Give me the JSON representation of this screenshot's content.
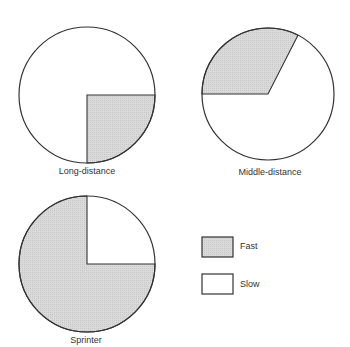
{
  "chart_data": [
    {
      "type": "pie",
      "title": "Long-distance",
      "categories": [
        "Fast",
        "Slow"
      ],
      "values": [
        25,
        75
      ],
      "layout": {
        "cx": 87,
        "cy": 95,
        "r": 68,
        "fast_start_deg": 0,
        "fast_end_deg": 90
      }
    },
    {
      "type": "pie",
      "title": "Middle-distance",
      "categories": [
        "Fast",
        "Slow"
      ],
      "values": [
        33,
        67
      ],
      "layout": {
        "cx": 268,
        "cy": 94,
        "r": 66,
        "fast_start_deg": 180,
        "fast_end_deg": 297
      }
    },
    {
      "type": "pie",
      "title": "Sprinter",
      "categories": [
        "Fast",
        "Slow"
      ],
      "values": [
        75,
        25
      ],
      "layout": {
        "cx": 87,
        "cy": 264,
        "r": 68,
        "fast_start_deg": 0,
        "fast_end_deg": 270
      }
    }
  ],
  "legend": {
    "items": [
      {
        "label": "Fast",
        "fill": "#d9d9d9"
      },
      {
        "label": "Slow",
        "fill": "#ffffff"
      }
    ]
  },
  "colors": {
    "fast": "#d9d9d9",
    "slow": "#ffffff",
    "stroke": "#333333"
  }
}
